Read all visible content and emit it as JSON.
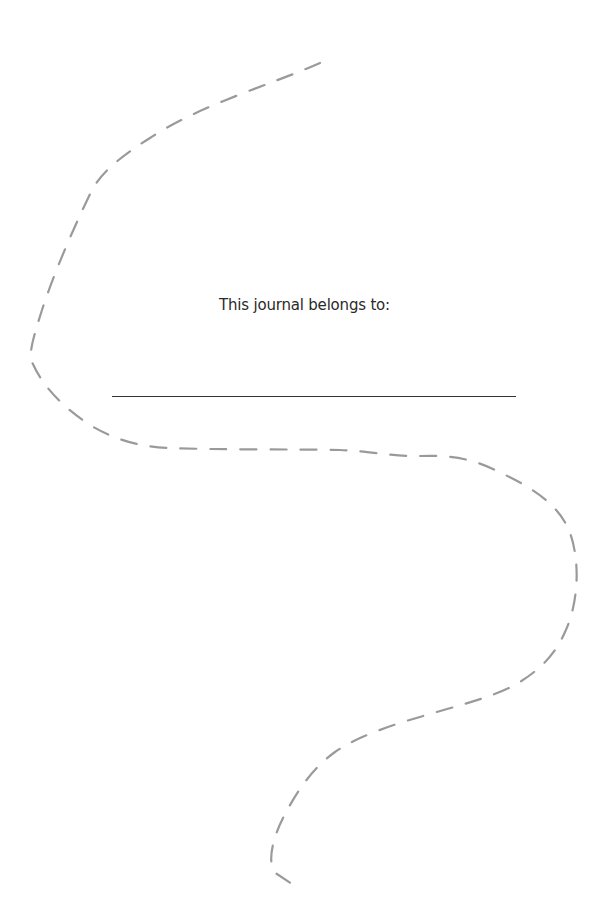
{
  "page": {
    "owner_label": "This journal belongs to:",
    "owner_name": "",
    "colors": {
      "background": "#ffffff",
      "dashed_curve": "#9a9a9a",
      "text": "#2a2a2a",
      "line": "#333333"
    }
  }
}
